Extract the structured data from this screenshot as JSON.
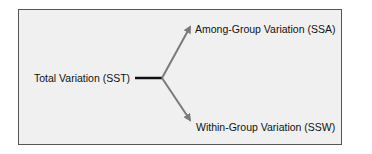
{
  "diagram": {
    "source_node": {
      "label": "Total Variation (SST)"
    },
    "branches": [
      {
        "label": "Among-Group Variation (SSA)"
      },
      {
        "label": "Within-Group Variation (SSW)"
      }
    ],
    "colors": {
      "background": "#f0f0f0",
      "border": "#555555",
      "stem": "#111111",
      "arrow": "#7a7a7a"
    }
  }
}
